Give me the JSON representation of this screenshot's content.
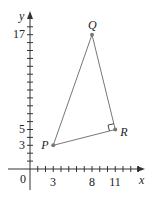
{
  "axes": {
    "x_label": "x",
    "y_label": "y",
    "origin_label": "0",
    "x_tick_labels": [
      {
        "value": 3,
        "text": "3"
      },
      {
        "value": 8,
        "text": "8"
      },
      {
        "value": 11,
        "text": "11"
      }
    ],
    "y_tick_labels": [
      {
        "value": 3,
        "text": "3"
      },
      {
        "value": 5,
        "text": "5"
      },
      {
        "value": 17,
        "text": "17"
      }
    ]
  },
  "points": {
    "P": {
      "label": "P",
      "x": 3,
      "y": 3
    },
    "Q": {
      "label": "Q",
      "x": 8,
      "y": 17
    },
    "R": {
      "label": "R",
      "x": 11,
      "y": 5
    }
  },
  "triangle": {
    "vertices": [
      "P",
      "Q",
      "R"
    ],
    "right_angle_at": "R"
  },
  "colors": {
    "axis": "#333333",
    "line": "#666666",
    "point": "#777777",
    "text": "#222222"
  }
}
